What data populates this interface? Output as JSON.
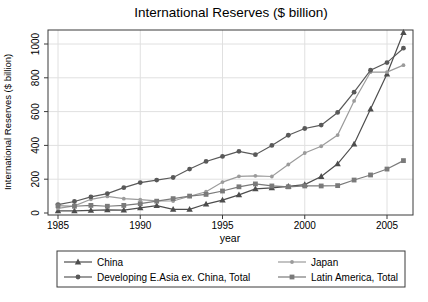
{
  "figure": {
    "background": "#ffffff",
    "grid_color": "#e0e0e0",
    "frame_color": "#3a3a3a",
    "text_color": "#000000"
  },
  "chart_data": {
    "type": "line",
    "title": "International Reserves ($ billion)",
    "xlabel": "year",
    "ylabel": "International Reserves ($ billion)",
    "x": [
      1985,
      1986,
      1987,
      1988,
      1989,
      1990,
      1991,
      1992,
      1993,
      1994,
      1995,
      1996,
      1997,
      1998,
      1999,
      2000,
      2001,
      2002,
      2003,
      2004,
      2005,
      2006
    ],
    "xticks": [
      1985,
      1990,
      1995,
      2000,
      2005
    ],
    "yticks": [
      0,
      200,
      400,
      600,
      800,
      1000
    ],
    "xlim": [
      1984.4,
      2006.6
    ],
    "ylim": [
      0,
      1080
    ],
    "grid": true,
    "legend_position": "bottom",
    "series": [
      {
        "name": "China",
        "marker": "triangle",
        "color": "#4d4d4d",
        "values": [
          13,
          12,
          16,
          19,
          17,
          30,
          44,
          21,
          22,
          53,
          76,
          107,
          143,
          149,
          158,
          168,
          216,
          291,
          408,
          615,
          822,
          1068
        ]
      },
      {
        "name": "Japan",
        "marker": "small-circle",
        "color": "#9b9b9b",
        "values": [
          27,
          42,
          81,
          98,
          85,
          79,
          72,
          71,
          99,
          126,
          183,
          217,
          220,
          216,
          287,
          355,
          395,
          461,
          663,
          834,
          834,
          875
        ]
      },
      {
        "name": "Developing E.Asia ex. China, Total",
        "marker": "circle",
        "color": "#595959",
        "values": [
          50,
          68,
          95,
          115,
          150,
          180,
          195,
          210,
          260,
          305,
          335,
          365,
          345,
          400,
          460,
          500,
          520,
          595,
          715,
          845,
          890,
          975
        ]
      },
      {
        "name": "Latin America, Total",
        "marker": "square",
        "color": "#7a7a7a",
        "values": [
          43,
          40,
          45,
          40,
          45,
          55,
          70,
          85,
          100,
          110,
          130,
          155,
          172,
          160,
          155,
          160,
          160,
          162,
          195,
          225,
          260,
          310
        ]
      }
    ]
  }
}
